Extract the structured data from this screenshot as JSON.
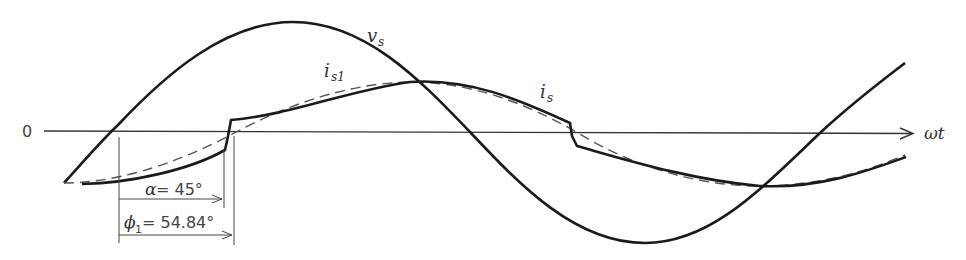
{
  "diagram": {
    "type": "waveform",
    "axis": {
      "origin_label": "0",
      "x_label": "ωt"
    },
    "curves": [
      {
        "name": "v_s",
        "label": "v",
        "subscript": "s",
        "style": "solid-thick",
        "color": "#1a1a1a"
      },
      {
        "name": "i_s",
        "label": "i",
        "subscript": "s",
        "style": "solid-thick",
        "color": "#1a1a1a"
      },
      {
        "name": "i_s1",
        "label": "i",
        "subscript": "s1",
        "style": "dashed",
        "color": "#555555"
      }
    ],
    "annotations": {
      "alpha": {
        "symbol": "α",
        "text": " = 45°"
      },
      "phi": {
        "symbol": "ϕ",
        "subscript": "1",
        "text": " = 54.84°"
      }
    }
  }
}
